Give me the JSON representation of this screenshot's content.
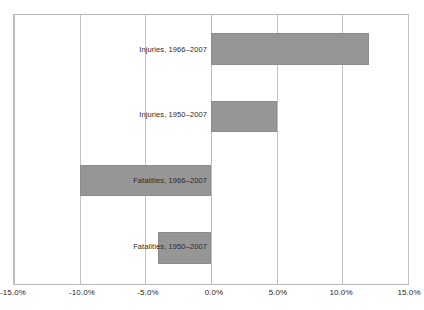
{
  "chart_data": {
    "type": "bar",
    "orientation": "horizontal",
    "title": "",
    "subtitle": "",
    "xlabel": "",
    "ylabel": "",
    "xlim": [
      -15,
      15
    ],
    "grid": true,
    "legend": false,
    "legend_position": "none",
    "bar_color": "#969696",
    "categories": [
      "Injuries, 1966–2007",
      "Injuries, 1950–2007",
      "Fatalities, 1966–2007",
      "Fatalities, 1950–2007"
    ],
    "values": [
      12.0,
      5.0,
      -10.0,
      -4.0
    ],
    "value_labels": [
      "12.0%",
      "5.0%",
      "-10.0%",
      "-4.0%"
    ],
    "xticks": [
      -15,
      -10,
      -5,
      0,
      5,
      10,
      15
    ],
    "xtick_labels": [
      "-15.0%",
      "-10.0%",
      "-5.0%",
      "0.0%",
      "5.0%",
      "10.0%",
      "15.0%"
    ]
  },
  "bars": [
    {
      "label": "Injuries, 1966–2007",
      "value": 12.0,
      "top": 32,
      "height": 32,
      "label_top": 44,
      "side": "positive"
    },
    {
      "label": "Injuries, 1950–2007",
      "value": 5.0,
      "top": 100,
      "height": 31,
      "label_top": 109,
      "side": "positive"
    },
    {
      "label": "Fatalities, 1966–2007",
      "value": -10.0,
      "top": 164,
      "height": 31,
      "label_top": 175,
      "side": "negative"
    },
    {
      "label": "Fatalities, 1950–2007",
      "value": -4.0,
      "top": 231,
      "height": 32,
      "label_top": 241,
      "side": "negative"
    }
  ],
  "axis": {
    "ticks": [
      {
        "value": -15,
        "label": "-15.0%",
        "x": 13
      },
      {
        "value": -10,
        "label": "-10.0%",
        "x": 82
      },
      {
        "value": -5,
        "label": "-5.0%",
        "x": 148
      },
      {
        "value": 0,
        "label": "0.0%",
        "x": 214
      },
      {
        "value": 5,
        "label": "5.0%",
        "x": 278
      },
      {
        "value": 10,
        "label": "10.0%",
        "x": 341
      },
      {
        "value": 15,
        "label": "15.0%",
        "x": 409
      }
    ]
  }
}
